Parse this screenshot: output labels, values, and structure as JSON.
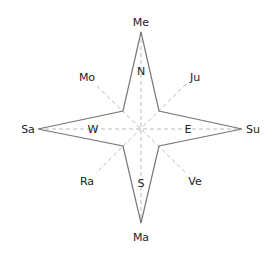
{
  "diagram": {
    "cardinal_points": [
      {
        "key": "top",
        "outer": "Me",
        "inner": "N"
      },
      {
        "key": "right",
        "outer": "Su",
        "inner": "E"
      },
      {
        "key": "bottom",
        "outer": "Ma",
        "inner": "S"
      },
      {
        "key": "left",
        "outer": "Sa",
        "inner": "W"
      }
    ],
    "diagonal_points": [
      {
        "key": "top-left",
        "label": "Mo"
      },
      {
        "key": "top-right",
        "label": "Ju"
      },
      {
        "key": "bottom-left",
        "label": "Ra"
      },
      {
        "key": "bottom-right",
        "label": "Ve"
      }
    ],
    "colors": {
      "outline": "#777777",
      "dashed": "#bbbbbb",
      "text": "#222222"
    }
  }
}
